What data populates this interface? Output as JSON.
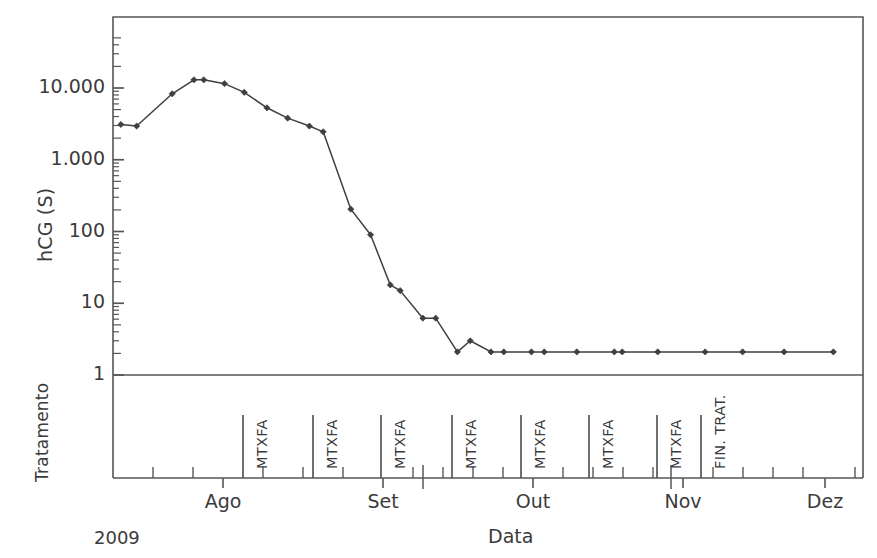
{
  "chart_data": {
    "type": "line",
    "title": "",
    "xlabel": "Data",
    "ylabel": "hCG (S)",
    "y_scale": "log",
    "ylim": [
      1,
      50000
    ],
    "grid": false,
    "legend": "none",
    "year_annotation": "2009",
    "second_axis_label": "Tratamento",
    "y_tick_labels": [
      "10.000",
      "1.000",
      "100",
      "10",
      "1"
    ],
    "y_tick_values": [
      10000,
      1000,
      100,
      10,
      1
    ],
    "x_tick_labels": [
      "Ago",
      "Set",
      "Out",
      "Nov",
      "Dez"
    ],
    "x_tick_values": [
      "2009-08-01",
      "2009-09-01",
      "2009-10-01",
      "2009-11-01",
      "2009-12-01"
    ],
    "series": [
      {
        "name": "hCG (S)",
        "marker": "diamond",
        "color": "#3f3f3f",
        "points": [
          {
            "x": 8,
            "y": 3100
          },
          {
            "x": 24,
            "y": 2950
          },
          {
            "x": 60,
            "y": 8300
          },
          {
            "x": 82,
            "y": 13000
          },
          {
            "x": 92,
            "y": 13000
          },
          {
            "x": 113,
            "y": 11500
          },
          {
            "x": 133,
            "y": 8700
          },
          {
            "x": 156,
            "y": 5300
          },
          {
            "x": 177,
            "y": 3800
          },
          {
            "x": 199,
            "y": 2950
          },
          {
            "x": 213,
            "y": 2450
          },
          {
            "x": 241,
            "y": 205
          },
          {
            "x": 261,
            "y": 90
          },
          {
            "x": 281,
            "y": 18
          },
          {
            "x": 291,
            "y": 15
          },
          {
            "x": 314,
            "y": 6.2
          },
          {
            "x": 327,
            "y": 6.2
          },
          {
            "x": 349,
            "y": 2.1
          },
          {
            "x": 362,
            "y": 3.0
          },
          {
            "x": 383,
            "y": 2.1
          },
          {
            "x": 396,
            "y": 2.1
          },
          {
            "x": 424,
            "y": 2.1
          },
          {
            "x": 437,
            "y": 2.1
          },
          {
            "x": 470,
            "y": 2.1
          },
          {
            "x": 508,
            "y": 2.1
          },
          {
            "x": 516,
            "y": 2.1
          },
          {
            "x": 552,
            "y": 2.1
          },
          {
            "x": 600,
            "y": 2.1
          },
          {
            "x": 638,
            "y": 2.1
          },
          {
            "x": 680,
            "y": 2.1
          },
          {
            "x": 730,
            "y": 2.1
          }
        ]
      }
    ],
    "treatment_events": [
      {
        "label": "MTXFA",
        "x": 130
      },
      {
        "label": "MTXFA",
        "x": 204
      },
      {
        "label": "MTXFA",
        "x": 276
      },
      {
        "label": "MTXFA",
        "x": 341
      },
      {
        "label": "MTXFA",
        "x": 413
      },
      {
        "label": "MTXFA",
        "x": 486
      },
      {
        "label": "MTXFA",
        "x": 558
      },
      {
        "label": "FIN. TRAT.",
        "x": 601
      }
    ]
  },
  "geometry": {
    "plot": {
      "left": 113,
      "right": 863,
      "top": 17,
      "baseline": 375
    },
    "treatment_band": {
      "top": 375,
      "axis": 478
    },
    "x_domain": [
      0,
      760
    ],
    "decade_px": 71.75,
    "month_ticks": [
      {
        "label": "Ago",
        "x": 223
      },
      {
        "label": "Set",
        "x": 383
      },
      {
        "label": "Out",
        "x": 533
      },
      {
        "label": "Nov",
        "x": 683
      },
      {
        "label": "Dez",
        "x": 825
      }
    ],
    "minor_ticks": [
      153,
      193,
      263,
      303,
      343,
      413,
      443,
      473,
      503,
      563,
      593,
      623,
      653,
      713,
      743,
      773,
      803,
      855
    ],
    "treatment_tick_x": [
      243,
      313,
      381,
      452,
      521,
      589,
      657,
      701
    ],
    "extra_long_ticks": [
      423,
      671
    ]
  },
  "colors": {
    "line": "#4a4a4a",
    "axis": "#565656",
    "text": "#3b3b3b",
    "background": "#ffffff"
  }
}
